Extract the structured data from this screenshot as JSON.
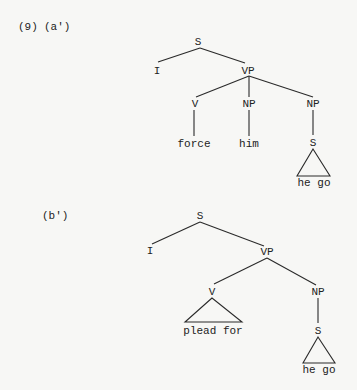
{
  "example": {
    "number": "(9)",
    "a_label": "(a')",
    "b_label": "(b')"
  },
  "tree_a": {
    "root": "S",
    "subject": "I",
    "vp": "VP",
    "v": "V",
    "np1": "NP",
    "np2": "NP",
    "v_word": "force",
    "np1_word": "him",
    "embedded_s": "S",
    "embedded_words": "he go"
  },
  "tree_b": {
    "root": "S",
    "subject": "I",
    "vp": "VP",
    "v": "V",
    "np": "NP",
    "v_words": "plead for",
    "embedded_s": "S",
    "embedded_words": "he go"
  },
  "colors": {
    "background": "#f7f7f5",
    "ink": "#222222"
  }
}
